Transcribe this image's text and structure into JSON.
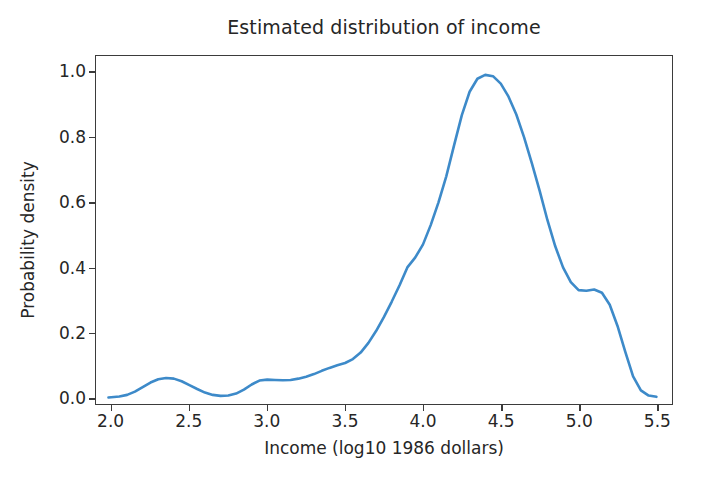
{
  "chart_data": {
    "type": "line",
    "title": "Estimated distribution of income",
    "xlabel": "Income (log10 1986 dollars)",
    "ylabel": "Probability density",
    "xlim": [
      1.9,
      5.6
    ],
    "ylim": [
      -0.02,
      1.05
    ],
    "xticks": [
      "2.0",
      "2.5",
      "3.0",
      "3.5",
      "4.0",
      "4.5",
      "5.0",
      "5.5"
    ],
    "xtick_values": [
      2.0,
      2.5,
      3.0,
      3.5,
      4.0,
      4.5,
      5.0,
      5.5
    ],
    "yticks": [
      "0.0",
      "0.2",
      "0.4",
      "0.6",
      "0.8",
      "1.0"
    ],
    "ytick_values": [
      0.0,
      0.2,
      0.4,
      0.6,
      0.8,
      1.0
    ],
    "grid": false,
    "legend": false,
    "line_color": "#3d8ac9",
    "line_width": 2.6,
    "series": [
      {
        "name": "Estimated density",
        "x": [
          1.98,
          2.05,
          2.1,
          2.15,
          2.2,
          2.25,
          2.3,
          2.35,
          2.4,
          2.45,
          2.5,
          2.55,
          2.6,
          2.65,
          2.7,
          2.75,
          2.8,
          2.85,
          2.9,
          2.95,
          3.0,
          3.05,
          3.1,
          3.15,
          3.2,
          3.25,
          3.3,
          3.35,
          3.4,
          3.45,
          3.5,
          3.55,
          3.6,
          3.65,
          3.7,
          3.75,
          3.8,
          3.85,
          3.9,
          3.95,
          4.0,
          4.05,
          4.1,
          4.15,
          4.2,
          4.25,
          4.3,
          4.35,
          4.4,
          4.45,
          4.5,
          4.55,
          4.6,
          4.65,
          4.7,
          4.75,
          4.8,
          4.85,
          4.9,
          4.95,
          5.0,
          5.05,
          5.1,
          5.15,
          5.2,
          5.25,
          5.3,
          5.35,
          5.4,
          5.45,
          5.5
        ],
        "y": [
          0.0,
          0.003,
          0.008,
          0.018,
          0.032,
          0.046,
          0.056,
          0.06,
          0.058,
          0.05,
          0.038,
          0.026,
          0.015,
          0.008,
          0.005,
          0.006,
          0.012,
          0.024,
          0.04,
          0.052,
          0.055,
          0.054,
          0.053,
          0.054,
          0.058,
          0.064,
          0.072,
          0.082,
          0.091,
          0.099,
          0.106,
          0.118,
          0.138,
          0.168,
          0.205,
          0.248,
          0.295,
          0.345,
          0.4,
          0.43,
          0.47,
          0.53,
          0.6,
          0.68,
          0.775,
          0.868,
          0.94,
          0.98,
          0.992,
          0.988,
          0.965,
          0.925,
          0.87,
          0.8,
          0.72,
          0.635,
          0.545,
          0.465,
          0.4,
          0.355,
          0.33,
          0.328,
          0.332,
          0.322,
          0.285,
          0.22,
          0.14,
          0.065,
          0.022,
          0.006,
          0.002
        ],
        "peak": {
          "x": 4.45,
          "y": 0.99
        },
        "secondary_modes": [
          {
            "x": 2.35,
            "y": 0.06
          },
          {
            "x": 3.0,
            "y": 0.055
          },
          {
            "x": 5.05,
            "y": 0.332
          }
        ]
      }
    ]
  },
  "axes": {
    "frame_color": "#3b3b3b",
    "background": "#ffffff",
    "tick_label_color": "#262626"
  }
}
